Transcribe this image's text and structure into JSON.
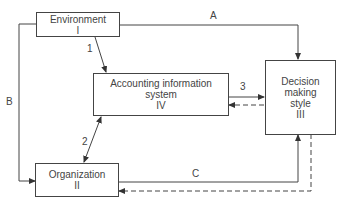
{
  "diagram": {
    "nodes": {
      "environment": {
        "title": "Environment",
        "numeral": "I"
      },
      "accounting": {
        "title_line1": "Accounting information",
        "title_line2": "system",
        "numeral": "IV"
      },
      "decision": {
        "title_line1": "Decision",
        "title_line2": "making",
        "title_line3": "style",
        "numeral": "III"
      },
      "organization": {
        "title": "Organization",
        "numeral": "II"
      }
    },
    "edges": {
      "A": "A",
      "B": "B",
      "C": "C",
      "one": "1",
      "two": "2",
      "three": "3"
    },
    "colors": {
      "line": "#444444",
      "background": "#ffffff"
    }
  }
}
